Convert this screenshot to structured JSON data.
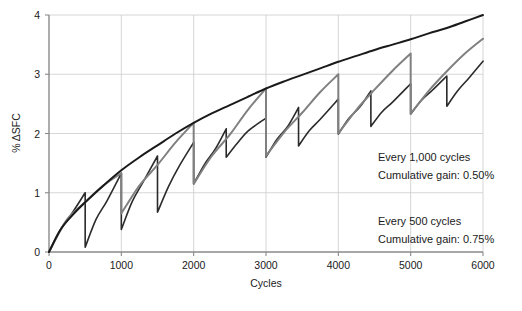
{
  "chart_data": {
    "type": "line",
    "title": "",
    "xlabel": "Cycles",
    "ylabel": "% ΔSFC",
    "xlim": [
      0,
      6000
    ],
    "ylim": [
      0,
      4
    ],
    "grid": true,
    "legend_position": "inside-right",
    "x_ticks": [
      0,
      1000,
      2000,
      3000,
      4000,
      5000,
      6000
    ],
    "x_tick_labels": [
      "0",
      "1000",
      "2000",
      "3000",
      "4000",
      "5000",
      "6000"
    ],
    "y_ticks": [
      0,
      1,
      2,
      3,
      4
    ],
    "y_tick_labels": [
      "0",
      "1",
      "2",
      "3",
      "4"
    ],
    "series": [
      {
        "name": "Baseline deterioration (no wash)",
        "color": "#1a1a1a",
        "width": 2.0,
        "pattern": "smooth",
        "points": [
          [
            0,
            0.0
          ],
          [
            150,
            0.36
          ],
          [
            300,
            0.59
          ],
          [
            500,
            0.84
          ],
          [
            750,
            1.12
          ],
          [
            1000,
            1.38
          ],
          [
            1250,
            1.6
          ],
          [
            1500,
            1.8
          ],
          [
            1750,
            2.0
          ],
          [
            2000,
            2.18
          ],
          [
            2250,
            2.34
          ],
          [
            2500,
            2.48
          ],
          [
            2750,
            2.62
          ],
          [
            3000,
            2.76
          ],
          [
            3250,
            2.88
          ],
          [
            3500,
            2.99
          ],
          [
            3750,
            3.1
          ],
          [
            4000,
            3.21
          ],
          [
            4250,
            3.31
          ],
          [
            4500,
            3.41
          ],
          [
            4750,
            3.5
          ],
          [
            5000,
            3.59
          ],
          [
            5250,
            3.69
          ],
          [
            5500,
            3.78
          ],
          [
            5750,
            3.89
          ],
          [
            6000,
            4.0
          ]
        ]
      },
      {
        "name": "Every 1,000 cycles",
        "color": "#808080",
        "width": 2.0,
        "pattern": "sawtooth",
        "wash_interval": 1000,
        "cumulative_gain": "0.50%",
        "peaks": [
          1.33,
          2.18,
          2.76,
          3.05,
          3.35
        ],
        "post_drop": [
          0.65,
          1.15,
          1.62,
          2.0,
          2.33
        ],
        "final_value": 3.6,
        "points": [
          [
            0,
            0.0
          ],
          [
            250,
            0.55
          ],
          [
            500,
            0.84
          ],
          [
            750,
            1.12
          ],
          [
            1000,
            1.33
          ],
          [
            1000,
            0.65
          ],
          [
            1250,
            1.12
          ],
          [
            1500,
            1.47
          ],
          [
            1750,
            1.85
          ],
          [
            2000,
            2.18
          ],
          [
            2000,
            1.15
          ],
          [
            2250,
            1.62
          ],
          [
            2500,
            1.98
          ],
          [
            2750,
            2.4
          ],
          [
            3000,
            2.76
          ],
          [
            3000,
            1.62
          ],
          [
            3250,
            2.02
          ],
          [
            3500,
            2.35
          ],
          [
            3750,
            2.7
          ],
          [
            4000,
            3.0
          ],
          [
            4000,
            2.0
          ],
          [
            4250,
            2.4
          ],
          [
            4500,
            2.74
          ],
          [
            4750,
            3.06
          ],
          [
            5000,
            3.35
          ],
          [
            5000,
            2.33
          ],
          [
            5250,
            2.72
          ],
          [
            5500,
            3.05
          ],
          [
            5750,
            3.35
          ],
          [
            6000,
            3.6
          ]
        ]
      },
      {
        "name": "Every 500 cycles",
        "color": "#2b2b2b",
        "width": 1.6,
        "pattern": "sawtooth",
        "wash_interval": 500,
        "cumulative_gain": "0.75%",
        "peaks": [
          1.0,
          1.33,
          1.62,
          1.85,
          2.08,
          2.26,
          2.44,
          2.58,
          2.72,
          2.84,
          2.97,
          3.08
        ],
        "post_drop": [
          0.08,
          0.38,
          0.67,
          1.15,
          1.44,
          1.6,
          1.79,
          1.99,
          2.12,
          2.26,
          2.33,
          2.46
        ],
        "final_value": 3.22,
        "points": [
          [
            0,
            0.0
          ],
          [
            150,
            0.36
          ],
          [
            300,
            0.62
          ],
          [
            500,
            1.0
          ],
          [
            500,
            0.08
          ],
          [
            650,
            0.55
          ],
          [
            800,
            0.86
          ],
          [
            1000,
            1.33
          ],
          [
            1000,
            0.38
          ],
          [
            1150,
            0.85
          ],
          [
            1300,
            1.18
          ],
          [
            1500,
            1.62
          ],
          [
            1500,
            0.67
          ],
          [
            1650,
            1.1
          ],
          [
            1800,
            1.45
          ],
          [
            2000,
            1.85
          ],
          [
            2000,
            1.15
          ],
          [
            2150,
            1.48
          ],
          [
            2300,
            1.74
          ],
          [
            2450,
            2.08
          ],
          [
            2450,
            1.6
          ],
          [
            2600,
            1.83
          ],
          [
            2750,
            2.04
          ],
          [
            3000,
            2.26
          ],
          [
            3000,
            1.6
          ],
          [
            3150,
            1.9
          ],
          [
            3300,
            2.12
          ],
          [
            3450,
            2.44
          ],
          [
            3450,
            1.79
          ],
          [
            3600,
            2.05
          ],
          [
            3750,
            2.24
          ],
          [
            4000,
            2.58
          ],
          [
            4000,
            1.99
          ],
          [
            4150,
            2.26
          ],
          [
            4300,
            2.45
          ],
          [
            4450,
            2.72
          ],
          [
            4450,
            2.12
          ],
          [
            4600,
            2.36
          ],
          [
            4750,
            2.53
          ],
          [
            5000,
            2.84
          ],
          [
            5000,
            2.33
          ],
          [
            5150,
            2.56
          ],
          [
            5300,
            2.73
          ],
          [
            5500,
            2.97
          ],
          [
            5500,
            2.46
          ],
          [
            5650,
            2.72
          ],
          [
            5800,
            2.93
          ],
          [
            6000,
            3.22
          ]
        ]
      }
    ],
    "annotations": [
      {
        "id": "annot-1000",
        "line1": "Every 1,000 cycles",
        "line2": "Cumulative gain: 0.50%"
      },
      {
        "id": "annot-500",
        "line1": "Every 500 cycles",
        "line2": "Cumulative gain: 0.75%"
      }
    ]
  }
}
